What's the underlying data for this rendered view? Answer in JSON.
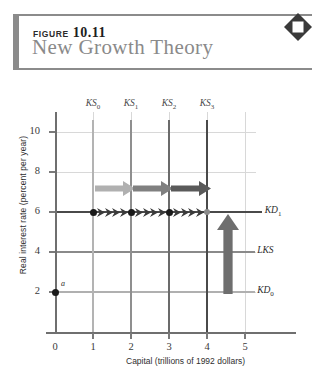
{
  "figure": {
    "label": "FIGURE",
    "number": "10.11",
    "title": "New Growth Theory",
    "corner_icon": "diamond-icon"
  },
  "chart_data": {
    "type": "line",
    "title": "New Growth Theory",
    "xlabel": "Capital (trillions of 1992 dollars)",
    "ylabel": "Real interest rate (percent per year)",
    "xlim": [
      0,
      5.6
    ],
    "ylim": [
      0,
      11
    ],
    "xticks": [
      "0",
      "1",
      "2",
      "3",
      "4",
      "5"
    ],
    "yticks": [
      "2",
      "4",
      "6",
      "8",
      "10"
    ],
    "grid": true,
    "legend_position": "right-inline",
    "vertical_lines": [
      {
        "name": "KS0",
        "label": "KS",
        "sub": "0",
        "x": 1,
        "color": "#b3b3b3",
        "width": 2.2
      },
      {
        "name": "KS1",
        "label": "KS",
        "sub": "1",
        "x": 2,
        "color": "#8f8f8f",
        "width": 2.4
      },
      {
        "name": "KS2",
        "label": "KS",
        "sub": "2",
        "x": 3,
        "color": "#6b6b6b",
        "width": 2.6
      },
      {
        "name": "KS3",
        "label": "KS",
        "sub": "3",
        "x": 4,
        "color": "#4a4a4a",
        "width": 2.6
      }
    ],
    "horizontal_lines": [
      {
        "name": "KD1",
        "label": "KD",
        "sub": "1",
        "y": 6,
        "color": "#4a4a4a",
        "width": 2.6
      },
      {
        "name": "LKS",
        "label": "LKS",
        "sub": "",
        "y": 4,
        "color": "#8a8a8a",
        "width": 1.6
      },
      {
        "name": "KD0",
        "label": "KD",
        "sub": "0",
        "y": 2,
        "color": "#b0b0b0",
        "width": 2.2
      }
    ],
    "points": [
      {
        "name": "a",
        "label": "a",
        "x": 0,
        "y": 2,
        "style": "filled"
      },
      {
        "name": "p1",
        "label": "",
        "x": 1,
        "y": 6,
        "style": "filled"
      },
      {
        "name": "p2",
        "label": "",
        "x": 2,
        "y": 6,
        "style": "filled"
      },
      {
        "name": "p3",
        "label": "",
        "x": 3,
        "y": 6,
        "style": "filled"
      },
      {
        "name": "p4",
        "label": "",
        "x": 4,
        "y": 6,
        "style": "open"
      }
    ],
    "shift_arrows": [
      {
        "name": "shift-arrow-1",
        "from_x": 1,
        "to_x": 2,
        "y": 7.2,
        "color": "#b0b0b0"
      },
      {
        "name": "shift-arrow-2",
        "from_x": 2,
        "to_x": 3,
        "y": 7.2,
        "color": "#808080"
      },
      {
        "name": "shift-arrow-3",
        "from_x": 3,
        "to_x": 4,
        "y": 7.2,
        "color": "#5a5a5a"
      }
    ],
    "vertical_arrow": {
      "name": "demand-shift-arrow",
      "x": 4.55,
      "from_y": 2,
      "to_y": 6,
      "color": "#6e6e6e"
    },
    "annotation": "Capital supply shifts rightward from KS0 to KS3 while capital demand shifts upward from KD0 to KD1; the real interest rate stays at 6 percent along KD1."
  }
}
